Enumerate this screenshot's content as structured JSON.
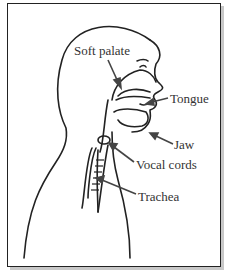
{
  "diagram": {
    "labels": [
      {
        "id": "soft-palate",
        "text": "Soft palate"
      },
      {
        "id": "tongue",
        "text": "Tongue"
      },
      {
        "id": "jaw",
        "text": "Jaw"
      },
      {
        "id": "vocal-cords",
        "text": "Vocal cords"
      },
      {
        "id": "trachea",
        "text": "Trachea"
      }
    ],
    "colors": {
      "line": "#222222",
      "text": "#333333",
      "arrow": "#444444",
      "border": "#222222",
      "shadow": "#c8c8c8"
    }
  }
}
